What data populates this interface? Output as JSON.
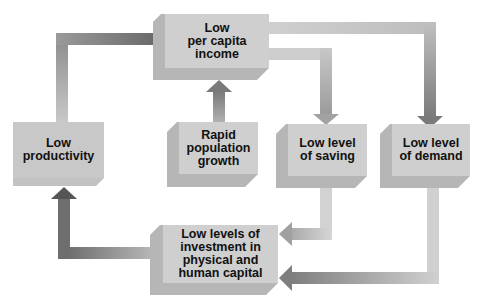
{
  "diagram": {
    "type": "flow-cycle",
    "title": "",
    "nodes": [
      {
        "id": "income",
        "label": "Low per capita income"
      },
      {
        "id": "productivity",
        "label": "Low productivity"
      },
      {
        "id": "population",
        "label": "Rapid population growth"
      },
      {
        "id": "saving",
        "label": "Low level of saving"
      },
      {
        "id": "demand",
        "label": "Low level of demand"
      },
      {
        "id": "investment",
        "label": "Low levels of investment in physical and human capital"
      }
    ],
    "edges": [
      {
        "from": "productivity",
        "to": "income"
      },
      {
        "from": "population",
        "to": "income"
      },
      {
        "from": "income",
        "to": "saving"
      },
      {
        "from": "income",
        "to": "demand"
      },
      {
        "from": "saving",
        "to": "investment"
      },
      {
        "from": "demand",
        "to": "investment"
      },
      {
        "from": "investment",
        "to": "productivity"
      }
    ]
  },
  "labels": {
    "income": [
      "Low",
      "per capita",
      "income"
    ],
    "productivity": [
      "Low",
      "productivity"
    ],
    "population": [
      "Rapid",
      "population",
      "growth"
    ],
    "saving": [
      "Low level",
      "of saving"
    ],
    "demand": [
      "Low level",
      "of demand"
    ],
    "investment": [
      "Low levels of",
      "investment in",
      "physical and",
      "human capital"
    ]
  },
  "colors": {
    "box_face": "#cfcfcf",
    "box_side": "#b4b4b4",
    "arrow_dark": "#6e6e6e",
    "arrow_light": "#c8c8c8"
  }
}
